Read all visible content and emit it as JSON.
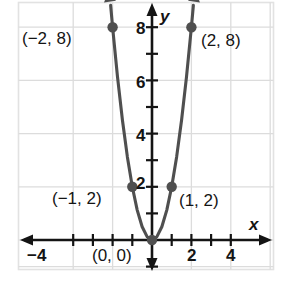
{
  "chart_data": {
    "type": "line",
    "title": "",
    "subtitle": "",
    "xlabel": "x",
    "ylabel": "y",
    "xlim": [
      -4.8,
      4.8
    ],
    "ylim": [
      -1.2,
      9.2
    ],
    "grid": true,
    "grid_step_x": 2,
    "grid_step_y": 2,
    "legend": "none",
    "function": "y = 2x^2",
    "series": [
      {
        "name": "y = 2x^2",
        "color": "#4f4f4f",
        "x": [
          -2.1,
          -2.0,
          -1.75,
          -1.5,
          -1.25,
          -1.0,
          -0.75,
          -0.5,
          -0.25,
          0,
          0.25,
          0.5,
          0.75,
          1.0,
          1.25,
          1.5,
          1.75,
          2.0,
          2.1
        ],
        "y": [
          8.82,
          8.0,
          6.125,
          4.5,
          3.125,
          2.0,
          1.125,
          0.5,
          0.125,
          0,
          0.125,
          0.5,
          1.125,
          2.0,
          3.125,
          4.5,
          6.125,
          8.0,
          8.82
        ]
      }
    ],
    "points": [
      {
        "x": -2,
        "y": 8,
        "label": "(−2, 8)",
        "label_side": "left"
      },
      {
        "x": -1,
        "y": 2,
        "label": "(−1, 2)",
        "label_side": "left"
      },
      {
        "x": 0,
        "y": 0,
        "label": "(0, 0)",
        "label_side": "below-left"
      },
      {
        "x": 1,
        "y": 2,
        "label": "(1, 2)",
        "label_side": "right"
      },
      {
        "x": 2,
        "y": 8,
        "label": "(2, 8)",
        "label_side": "right"
      }
    ],
    "x_ticks": [
      -4,
      -3,
      -2,
      -1,
      1,
      2,
      3,
      4
    ],
    "x_tick_labels": [
      {
        "value": -4,
        "text": "−4"
      },
      {
        "value": 2,
        "text": "2"
      },
      {
        "value": 4,
        "text": "4"
      }
    ],
    "y_ticks": [
      1,
      2,
      3,
      4,
      5,
      6,
      7,
      8
    ],
    "y_tick_labels": [
      {
        "value": 2,
        "text": "2"
      },
      {
        "value": 4,
        "text": "4"
      },
      {
        "value": 6,
        "text": "6"
      },
      {
        "value": 8,
        "text": "8"
      }
    ],
    "colors": {
      "curve": "#4f4f4f",
      "point": "#4f4f4f",
      "axis": "#141414",
      "grid": "#d8d8d8",
      "frame": "#e2e2e2",
      "text": "#141414",
      "background": "#ffffff"
    }
  },
  "labels": {
    "x_axis_name": "x",
    "y_axis_name": "y",
    "tick_x_neg4": "−4",
    "tick_x_2": "2",
    "tick_x_4": "4",
    "tick_y_2": "2",
    "tick_y_4": "4",
    "tick_y_6": "6",
    "tick_y_8": "8",
    "point_neg2_8": "(−2, 8)",
    "point_neg1_2": "(−1, 2)",
    "point_0_0": "(0, 0)",
    "point_1_2": "(1, 2)",
    "point_2_8": "(2, 8)"
  }
}
